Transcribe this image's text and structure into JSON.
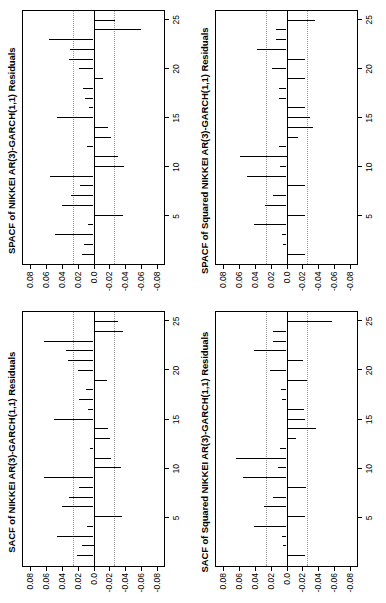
{
  "figure": {
    "rotation_note": "rotated",
    "background": "#ffffff",
    "ink": "#000000",
    "confidence_band_color": "#999999"
  },
  "axes": {
    "y_ticks": [
      "0.08",
      "0.06",
      "0.04",
      "0.02",
      "0.0",
      "-0.02",
      "-0.04",
      "-0.06",
      "-0.08"
    ],
    "y_values": [
      0.08,
      0.06,
      0.04,
      0.02,
      0.0,
      -0.02,
      -0.04,
      -0.06,
      -0.08
    ],
    "x_ticks": [
      "5",
      "10",
      "15",
      "20",
      "25"
    ],
    "x_values": [
      5,
      10,
      15,
      20,
      25
    ],
    "ylim": [
      -0.09,
      0.09
    ],
    "xlim": [
      0,
      26
    ]
  },
  "chart_data": [
    {
      "type": "bar",
      "panel": "top-left",
      "title": "SACF of NIKKEI AR(3)-GARCH(1,1) Residuals",
      "xlabel": "",
      "ylabel": "",
      "xlim": [
        0,
        26
      ],
      "ylim": [
        -0.09,
        0.09
      ],
      "grid": false,
      "legend": "none",
      "confidence_bands": [
        0.0265,
        -0.0265
      ],
      "x": [
        1,
        2,
        3,
        4,
        5,
        6,
        7,
        8,
        9,
        10,
        11,
        12,
        13,
        14,
        15,
        16,
        17,
        18,
        19,
        20,
        21,
        22,
        23,
        24,
        25
      ],
      "values": [
        0.021,
        0.015,
        0.046,
        0.008,
        -0.037,
        0.04,
        0.031,
        0.018,
        0.063,
        -0.035,
        -0.022,
        0.005,
        -0.021,
        -0.018,
        0.051,
        0.007,
        0.019,
        0.01,
        -0.017,
        0.02,
        0.033,
        0.035,
        0.063,
        -0.038,
        -0.031
      ]
    },
    {
      "type": "bar",
      "panel": "top-right",
      "title": "SPACF of NIKKEI AR(3)-GARCH(1,1) Residuals",
      "xlabel": "",
      "ylabel": "",
      "xlim": [
        0,
        26
      ],
      "ylim": [
        -0.09,
        0.09
      ],
      "grid": false,
      "legend": "none",
      "confidence_bands": [
        0.0265,
        -0.0265
      ],
      "x": [
        1,
        2,
        3,
        4,
        5,
        6,
        7,
        8,
        9,
        10,
        11,
        12,
        13,
        14,
        15,
        16,
        17,
        18,
        19,
        20,
        21,
        22,
        23,
        24,
        25
      ],
      "values": [
        0.015,
        0.012,
        0.049,
        0.007,
        -0.038,
        0.04,
        0.029,
        0.017,
        0.055,
        -0.039,
        -0.031,
        0.008,
        -0.022,
        -0.018,
        0.047,
        0.006,
        0.011,
        0.013,
        -0.012,
        0.019,
        0.031,
        0.03,
        0.057,
        -0.06,
        -0.027
      ]
    },
    {
      "type": "bar",
      "panel": "bottom-left",
      "title": "SACF of Squared NIKKEI AR(3)-GARCH(1,1) Residuals",
      "xlabel": "",
      "ylabel": "",
      "xlim": [
        0,
        26
      ],
      "ylim": [
        -0.09,
        0.09
      ],
      "grid": false,
      "legend": "none",
      "confidence_bands": [
        0.0265,
        -0.0265
      ],
      "x": [
        1,
        2,
        3,
        4,
        5,
        6,
        7,
        8,
        9,
        10,
        11,
        12,
        13,
        14,
        15,
        16,
        17,
        18,
        19,
        20,
        21,
        22,
        23,
        24,
        25
      ],
      "values": [
        -0.023,
        0.004,
        0.006,
        0.041,
        -0.023,
        0.029,
        0.017,
        -0.025,
        0.055,
        0.011,
        0.065,
        0.008,
        -0.012,
        -0.038,
        -0.024,
        -0.022,
        0.006,
        0.007,
        -0.026,
        0.021,
        -0.021,
        0.042,
        0.017,
        0.017,
        -0.058
      ]
    },
    {
      "type": "bar",
      "panel": "bottom-right",
      "title": "SPACF of Squared NIKKEI AR(3)-GARCH(1,1) Residuals",
      "xlabel": "",
      "ylabel": "",
      "xlim": [
        0,
        26
      ],
      "ylim": [
        -0.09,
        0.09
      ],
      "grid": false,
      "legend": "none",
      "confidence_bands": [
        0.0265,
        -0.0265
      ],
      "x": [
        1,
        2,
        3,
        4,
        5,
        6,
        7,
        8,
        9,
        10,
        11,
        12,
        13,
        14,
        15,
        16,
        17,
        18,
        19,
        20,
        21,
        22,
        23,
        24,
        25
      ],
      "values": [
        -0.024,
        0.004,
        0.006,
        0.041,
        -0.023,
        0.027,
        0.017,
        -0.023,
        0.051,
        0.008,
        0.06,
        0.01,
        -0.015,
        -0.034,
        -0.03,
        -0.024,
        0.009,
        0.009,
        -0.024,
        0.019,
        -0.023,
        0.038,
        0.014,
        0.014,
        -0.036
      ]
    }
  ]
}
